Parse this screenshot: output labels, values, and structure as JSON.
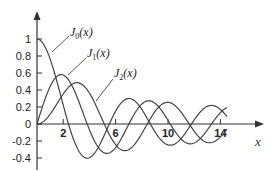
{
  "chart_data": {
    "type": "line",
    "title": "",
    "xlabel": "x",
    "ylabel": "",
    "xlim": [
      0,
      14.5
    ],
    "ylim": [
      -0.4,
      1.0
    ],
    "grid": false,
    "legend_position": "inline labels with leader lines",
    "x_ticks": [
      "2",
      "6",
      "10",
      "14"
    ],
    "y_ticks": [
      "1",
      "0.8",
      "0.6",
      "0.4",
      "0.2",
      "0",
      "-0.2",
      "-0.4"
    ],
    "series": [
      {
        "name": "J0(x)",
        "label_main": "J",
        "label_sub": "0",
        "label_arg": "(x)",
        "function": "besselJ0",
        "x": [
          0,
          1,
          2,
          2.405,
          3,
          3.83,
          4,
          5,
          5.52,
          6,
          7,
          7.02,
          8,
          8.65,
          9,
          10,
          11,
          11.79,
          12,
          13,
          14,
          14.5
        ],
        "values": [
          1,
          0.765,
          0.224,
          0,
          -0.26,
          -0.403,
          -0.397,
          -0.178,
          0,
          0.151,
          0.3,
          0.3,
          0.172,
          0,
          -0.09,
          -0.246,
          -0.171,
          0,
          0.048,
          0.207,
          0.171,
          0.09
        ]
      },
      {
        "name": "J1(x)",
        "label_main": "J",
        "label_sub": "1",
        "label_arg": "(x)",
        "function": "besselJ1",
        "x": [
          0,
          1,
          1.84,
          2,
          3,
          3.83,
          4,
          5,
          5.33,
          6,
          7,
          7.02,
          8,
          8.54,
          9,
          10,
          10.17,
          11,
          12,
          13,
          13.32,
          14,
          14.5
        ],
        "values": [
          0,
          0.44,
          0.582,
          0.577,
          0.339,
          0,
          -0.066,
          -0.328,
          -0.346,
          -0.277,
          -0.005,
          0,
          0.235,
          0.273,
          0.245,
          0.043,
          0,
          -0.177,
          -0.223,
          -0.07,
          0,
          0.133,
          0.193
        ]
      },
      {
        "name": "J2(x)",
        "label_main": "J",
        "label_sub": "2",
        "label_arg": "(x)",
        "function": "besselJ2",
        "x": [
          0,
          1,
          2,
          3,
          3.05,
          4,
          5,
          5.14,
          6,
          6.71,
          7,
          8,
          8.42,
          9,
          9.97,
          10,
          11,
          11.62,
          12,
          13,
          13.2,
          14,
          14.5
        ],
        "values": [
          0,
          0.115,
          0.353,
          0.486,
          0.486,
          0.364,
          0.047,
          0,
          -0.243,
          -0.301,
          -0.301,
          -0.113,
          0,
          0.145,
          0.255,
          0.255,
          0.139,
          0,
          -0.085,
          -0.218,
          -0.217,
          -0.152,
          -0.07
        ]
      }
    ]
  },
  "colors": {
    "curve": "#444444",
    "axis": "#333333",
    "background": "#ffffff"
  }
}
